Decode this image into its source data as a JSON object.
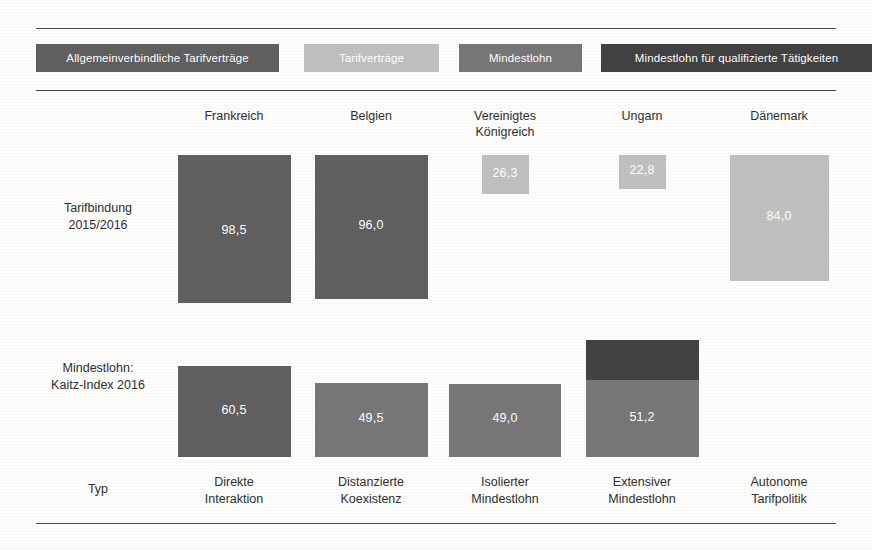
{
  "colors": {
    "collective_agreements_binding": "#606060",
    "collective_agreements": "#c0c0c0",
    "minimum_wage": "#777777",
    "minimum_wage_qualified": "#424242",
    "rule": "#4a4a4a",
    "value_text": "#ffffff",
    "background": "#fdfdfc"
  },
  "legend": {
    "items": [
      {
        "label": "Allgemeinverbindliche Tarifverträge",
        "color_key": "collective_agreements_binding"
      },
      {
        "label": "Tarifverträge",
        "color_key": "collective_agreements"
      },
      {
        "label": "Mindestlohn",
        "color_key": "minimum_wage"
      },
      {
        "label": "Mindestlohn für qualifizierte Tätigkeiten",
        "color_key": "minimum_wage_qualified"
      }
    ]
  },
  "row_labels": {
    "row1": "Tarifbindung\n2015/2016",
    "row1_line1": "Tarifbindung",
    "row1_line2": "2015/2016",
    "row2_line1": "Mindestlohn:",
    "row2_line2": "Kaitz-Index 2016",
    "row3": "Typ"
  },
  "chart_data": {
    "type": "bar",
    "title": "",
    "xlabel": "",
    "ylabel": "",
    "categories": [
      "Frankreich",
      "Belgien",
      "Vereinigtes Königreich",
      "Ungarn",
      "Dänemark"
    ],
    "rows": [
      {
        "name": "Tarifbindung 2015/2016",
        "values": [
          98.5,
          96.0,
          26.3,
          22.8,
          84.0
        ]
      },
      {
        "name": "Mindestlohn: Kaitz-Index 2016",
        "values": [
          60.5,
          49.5,
          49.0,
          51.2,
          null
        ]
      }
    ],
    "series": [
      {
        "name": "Tarifbindung 2015/2016",
        "values": [
          98.5,
          96.0,
          26.3,
          22.8,
          84.0
        ]
      },
      {
        "name": "Mindestlohn: Kaitz-Index 2016",
        "values": [
          60.5,
          49.5,
          49.0,
          51.2,
          null
        ]
      }
    ],
    "columns": [
      {
        "country": "Frankreich",
        "country_line1": "Frankreich",
        "country_line2": "",
        "type_line1": "Direkte",
        "type_line2": "Interaktion",
        "tarifbindung_value": 98.5,
        "tarifbindung_label": "98,5",
        "tarifbindung_color_key": "collective_agreements_binding",
        "kaitz_value": 60.5,
        "kaitz_label": "60,5",
        "kaitz_color_key": "collective_agreements_binding",
        "qualified_segment": false
      },
      {
        "country": "Belgien",
        "country_line1": "Belgien",
        "country_line2": "",
        "type_line1": "Distanzierte",
        "type_line2": "Koexistenz",
        "tarifbindung_value": 96.0,
        "tarifbindung_label": "96,0",
        "tarifbindung_color_key": "collective_agreements_binding",
        "kaitz_value": 49.5,
        "kaitz_label": "49,5",
        "kaitz_color_key": "minimum_wage",
        "qualified_segment": false
      },
      {
        "country": "Vereinigtes Königreich",
        "country_line1": "Vereinigtes",
        "country_line2": "Königreich",
        "type_line1": "Isolierter",
        "type_line2": "Mindestlohn",
        "tarifbindung_value": 26.3,
        "tarifbindung_label": "26,3",
        "tarifbindung_color_key": "collective_agreements",
        "kaitz_value": 49.0,
        "kaitz_label": "49,0",
        "kaitz_color_key": "minimum_wage",
        "qualified_segment": false
      },
      {
        "country": "Ungarn",
        "country_line1": "Ungarn",
        "country_line2": "",
        "type_line1": "Extensiver",
        "type_line2": "Mindestlohn",
        "tarifbindung_value": 22.8,
        "tarifbindung_label": "22,8",
        "tarifbindung_color_key": "collective_agreements",
        "kaitz_value": 51.2,
        "kaitz_label": "51,2",
        "kaitz_color_key": "minimum_wage",
        "qualified_segment": true,
        "qualified_color_key": "minimum_wage_qualified"
      },
      {
        "country": "Dänemark",
        "country_line1": "Dänemark",
        "country_line2": "",
        "type_line1": "Autonome",
        "type_line2": "Tarifpolitik",
        "tarifbindung_value": 84.0,
        "tarifbindung_label": "84,0",
        "tarifbindung_color_key": "collective_agreements",
        "kaitz_value": null,
        "kaitz_label": "",
        "kaitz_color_key": null,
        "qualified_segment": false
      }
    ]
  }
}
